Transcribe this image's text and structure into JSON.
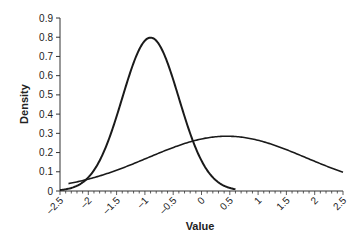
{
  "chart_data": {
    "type": "line",
    "title": "",
    "xlabel": "Value",
    "ylabel": "Density",
    "xlim": [
      -2.5,
      2.5
    ],
    "ylim": [
      0,
      0.9
    ],
    "x_ticks": [
      "-2.5",
      "-2",
      "-1.5",
      "-1",
      "-0.5",
      "0",
      "0.5",
      "1",
      "1.5",
      "2",
      "2.5"
    ],
    "y_ticks": [
      "0",
      "0.1",
      "0.2",
      "0.3",
      "0.4",
      "0.5",
      "0.6",
      "0.7",
      "0.8",
      "0.9"
    ],
    "grid": false,
    "legend": null,
    "series": [
      {
        "name": "narrow density",
        "distribution": "normal",
        "mean": -0.9,
        "sd": 0.5,
        "x_range": [
          -2.5,
          0.6
        ],
        "peak": {
          "x": -0.9,
          "y": 0.8
        }
      },
      {
        "name": "broad density",
        "distribution": "normal",
        "mean": 0.45,
        "sd": 1.4,
        "x_range": [
          -2.35,
          2.5
        ],
        "peak": {
          "x": 0.45,
          "y": 0.29
        }
      }
    ]
  }
}
